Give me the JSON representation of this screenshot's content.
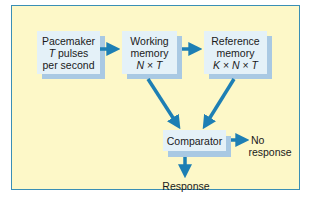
{
  "diagram": {
    "type": "flowchart",
    "nodes": [
      {
        "id": "pacemaker",
        "lines": [
          "Pacemaker",
          "T pulses",
          "per second"
        ]
      },
      {
        "id": "working_memory",
        "lines": [
          "Working",
          "memory",
          "N × T"
        ]
      },
      {
        "id": "reference_memory",
        "lines": [
          "Reference",
          "memory",
          "K × N × T"
        ]
      },
      {
        "id": "comparator",
        "lines": [
          "Comparator"
        ]
      }
    ],
    "outputs": {
      "no_response": [
        "No",
        "response"
      ],
      "response": "Response"
    },
    "edges": [
      [
        "pacemaker",
        "working_memory"
      ],
      [
        "working_memory",
        "reference_memory"
      ],
      [
        "working_memory",
        "comparator"
      ],
      [
        "reference_memory",
        "comparator"
      ],
      [
        "comparator",
        "no_response"
      ],
      [
        "comparator",
        "response"
      ]
    ],
    "colors": {
      "background": "#fdf8c8",
      "frame_border": "#3a8fb5",
      "box_fill": "#e4f1f8",
      "box_shadow": "#a9c9e3",
      "arrow": "#1d7fb4"
    }
  }
}
